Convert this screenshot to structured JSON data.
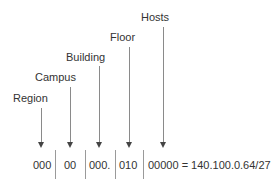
{
  "diagram": {
    "labels": {
      "region": "Region",
      "campus": "Campus",
      "building": "Building",
      "floor": "Floor",
      "hosts": "Hosts"
    },
    "address_segments": {
      "region": "000",
      "campus": "00",
      "building": "000.",
      "floor": "010",
      "hosts": "00000 = 140.100.0.64/27"
    },
    "colors": {
      "text": "#333333",
      "arrow_line": "#8a8a8a",
      "arrowhead": "#444444",
      "separator": "#9a9a9a"
    }
  }
}
